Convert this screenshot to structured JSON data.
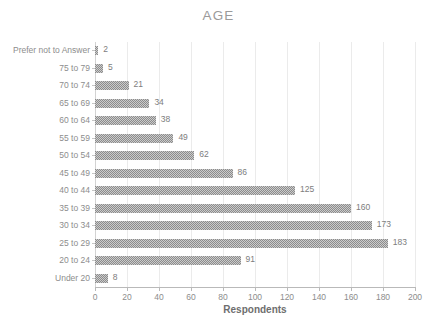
{
  "chart_data": {
    "type": "bar",
    "orientation": "horizontal",
    "title": "AGE",
    "xlabel": "Respondents",
    "ylabel": "",
    "xlim": [
      0,
      200
    ],
    "xticks": [
      0,
      20,
      40,
      60,
      80,
      100,
      120,
      140,
      160,
      180,
      200
    ],
    "grid": true,
    "legend": false,
    "categories": [
      "Prefer not to Answer",
      "75 to 79",
      "70 to 74",
      "65 to 69",
      "60 to 64",
      "55 to 59",
      "50 to 54",
      "45 to 49",
      "40 to 44",
      "35 to 39",
      "30 to 34",
      "25 to 29",
      "20 to 24",
      "Under 20"
    ],
    "values": [
      2,
      5,
      21,
      34,
      38,
      49,
      62,
      86,
      125,
      160,
      173,
      183,
      91,
      8
    ],
    "data_labels": [
      "2",
      "5",
      "21",
      "34",
      "38",
      "49",
      "62",
      "86",
      "125",
      "160",
      "173",
      "183",
      "91",
      "8"
    ],
    "bar_color": "#8c8c8c",
    "grid_color": "#ebebeb",
    "axis_color": "#b9b9b9",
    "label_color": "#8d8d8d",
    "title_color": "#9a9a9a"
  }
}
